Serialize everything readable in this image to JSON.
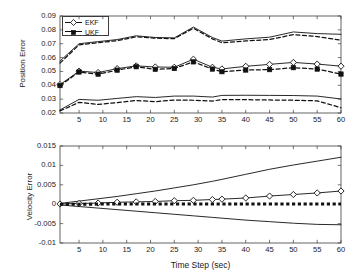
{
  "chart_data": [
    {
      "id": "position-error",
      "type": "line",
      "title": "",
      "xlabel": "",
      "ylabel": "Position Error",
      "xlim": [
        1,
        60
      ],
      "ylim": [
        0.02,
        0.09
      ],
      "xticks": [
        5,
        10,
        15,
        20,
        25,
        30,
        35,
        40,
        45,
        50,
        55,
        60
      ],
      "yticks": [
        0.02,
        0.03,
        0.04,
        0.05,
        0.06,
        0.07,
        0.08,
        0.09
      ],
      "grid": false,
      "legend": {
        "position": "top-left",
        "entries": [
          "EKF",
          "UKF"
        ]
      },
      "x": [
        1,
        5,
        9,
        13,
        17,
        21,
        25,
        29,
        33,
        35,
        40,
        45,
        50,
        55,
        60
      ],
      "series": [
        {
          "name": "EKF upper bound",
          "style": "solid",
          "marker": "none",
          "values": [
            0.0575,
            0.07,
            0.0715,
            0.073,
            0.0757,
            0.0745,
            0.0742,
            0.082,
            0.0745,
            0.0719,
            0.0735,
            0.0747,
            0.0785,
            0.0773,
            0.0768
          ]
        },
        {
          "name": "UKF upper bound",
          "style": "dashed",
          "marker": "none",
          "values": [
            0.056,
            0.0692,
            0.0707,
            0.0722,
            0.075,
            0.074,
            0.0736,
            0.0812,
            0.0735,
            0.0707,
            0.072,
            0.073,
            0.0766,
            0.0752,
            0.0725
          ]
        },
        {
          "name": "EKF",
          "style": "solid",
          "marker": "diamond-open",
          "values": [
            0.0405,
            0.0502,
            0.0492,
            0.052,
            0.054,
            0.0532,
            0.053,
            0.0588,
            0.053,
            0.0518,
            0.0537,
            0.0551,
            0.0565,
            0.0553,
            0.0538
          ]
        },
        {
          "name": "UKF",
          "style": "dashed",
          "marker": "square-filled",
          "values": [
            0.0398,
            0.0496,
            0.048,
            0.0509,
            0.0534,
            0.0515,
            0.0521,
            0.0569,
            0.0517,
            0.0498,
            0.051,
            0.0513,
            0.0527,
            0.0517,
            0.0481
          ]
        },
        {
          "name": "EKF lower bound",
          "style": "solid",
          "marker": "none",
          "values": [
            0.0222,
            0.0298,
            0.0292,
            0.0305,
            0.0318,
            0.0312,
            0.0322,
            0.0322,
            0.0315,
            0.0327,
            0.0328,
            0.0327,
            0.0326,
            0.0322,
            0.0301
          ]
        },
        {
          "name": "UKF lower bound",
          "style": "dashed",
          "marker": "none",
          "values": [
            0.0215,
            0.0277,
            0.0262,
            0.0275,
            0.029,
            0.0282,
            0.0293,
            0.0292,
            0.0286,
            0.0297,
            0.0296,
            0.0294,
            0.0292,
            0.0288,
            0.0238
          ]
        }
      ]
    },
    {
      "id": "velocity-error",
      "type": "line",
      "title": "",
      "xlabel": "Time Step (sec)",
      "ylabel": "Velocity Error",
      "xlim": [
        1,
        60
      ],
      "ylim": [
        -0.01,
        0.015
      ],
      "xticks": [
        5,
        10,
        15,
        20,
        25,
        30,
        35,
        40,
        45,
        50,
        55,
        60
      ],
      "yticks": [
        -0.01,
        -0.005,
        0,
        0.005,
        0.01,
        0.015
      ],
      "ytick_labels": [
        "-0.01",
        "-0.005",
        "0",
        "0.005",
        "0.01",
        "0.015"
      ],
      "grid": false,
      "legend": {
        "position": "none",
        "entries": []
      },
      "x": [
        1,
        5,
        9,
        13,
        17,
        21,
        25,
        29,
        33,
        35,
        40,
        45,
        50,
        55,
        60
      ],
      "series": [
        {
          "name": "EKF upper bound",
          "style": "solid",
          "marker": "none",
          "values": [
            0.0002,
            0.0008,
            0.0014,
            0.002,
            0.0027,
            0.0034,
            0.0042,
            0.005,
            0.0059,
            0.0064,
            0.0077,
            0.009,
            0.0101,
            0.0111,
            0.0121
          ]
        },
        {
          "name": "EKF",
          "style": "solid",
          "marker": "diamond-open",
          "values": [
            5e-05,
            0.0002,
            0.0003,
            0.0005,
            0.0006,
            0.0007,
            0.0009,
            0.001,
            0.0012,
            0.0013,
            0.0016,
            0.0021,
            0.0025,
            0.0029,
            0.0034
          ]
        },
        {
          "name": "UKF",
          "style": "dashed-heavy",
          "marker": "square-filled",
          "values": [
            0.0,
            0.0,
            2e-05,
            2e-05,
            3e-05,
            3e-05,
            3e-05,
            3e-05,
            3e-05,
            3e-05,
            3e-05,
            3e-05,
            3e-05,
            3e-05,
            3e-05
          ]
        },
        {
          "name": "EKF lower bound",
          "style": "solid",
          "marker": "none",
          "values": [
            -0.0002,
            -0.0006,
            -0.001,
            -0.0014,
            -0.0018,
            -0.0022,
            -0.0026,
            -0.003,
            -0.0034,
            -0.0036,
            -0.0041,
            -0.0045,
            -0.0049,
            -0.0052,
            -0.0053
          ]
        }
      ]
    }
  ],
  "labels": {
    "top": {
      "ylabel": "Position Error",
      "yticks": [
        "0.09",
        "0.08",
        "0.07",
        "0.06",
        "0.05",
        "0.04",
        "0.03",
        "0.02"
      ],
      "xticks": [
        "5",
        "10",
        "15",
        "20",
        "25",
        "30",
        "35",
        "40",
        "45",
        "50",
        "55",
        "60"
      ],
      "legend_ekf": "EKF",
      "legend_ukf": "UKF"
    },
    "bottom": {
      "ylabel": "Velocity Error",
      "yticks": [
        "0.015",
        "0.01",
        "0.005",
        "0",
        "-0.005",
        "-0.01"
      ],
      "xticks": [
        "5",
        "10",
        "15",
        "20",
        "25",
        "30",
        "35",
        "40",
        "45",
        "50",
        "55",
        "60"
      ],
      "xlabel": "Time Step (sec)"
    }
  },
  "colors": {
    "axis": "#3c3c3c",
    "line": "#111111",
    "background": "#ffffff",
    "text": "#1a1a1a"
  }
}
